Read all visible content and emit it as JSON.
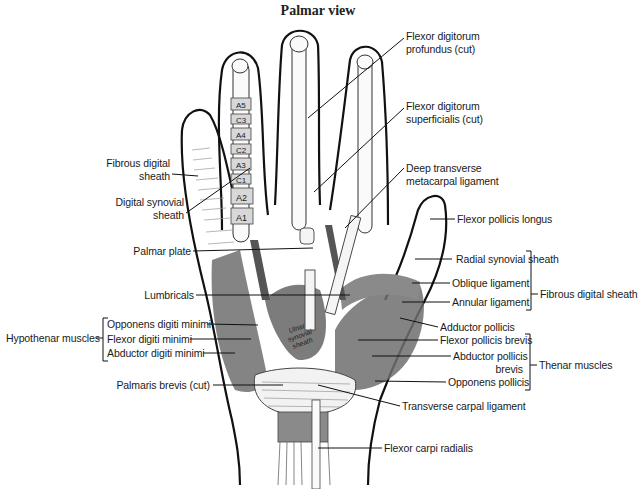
{
  "title": "Palmar view",
  "labels": {
    "fdp": [
      "Flexor digitorum",
      "profundus (cut)"
    ],
    "fds": [
      "Flexor digitorum",
      "superficialis (cut)"
    ],
    "dtml": [
      "Deep transverse",
      "metacarpal ligament"
    ],
    "fpl": "Flexor pollicis longus",
    "rss": "Radial synovial sheath",
    "oblique": "Oblique ligament",
    "annular": "Annular ligament",
    "fds_group": "Fibrous digital sheath",
    "add_poll": "Adductor pollicis",
    "fpb": "Flexor pollicis brevis",
    "apb": [
      "Abductor pollicis",
      "brevis"
    ],
    "op": "Opponens pollicis",
    "thenar": "Thenar muscles",
    "tcl": "Transverse carpal ligament",
    "fcr": "Flexor carpi radialis",
    "fib_sheath": [
      "Fibrous digital",
      "sheath"
    ],
    "dig_syn": [
      "Digital synovial",
      "sheath"
    ],
    "palmar_plate": "Palmar plate",
    "lumbricals": "Lumbricals",
    "odm": "Opponens digiti minimi",
    "fdm": "Flexor digiti minimi",
    "adm": "Abductor digiti minimi",
    "hypothenar": "Hypothenar muscles",
    "palmaris": "Palmaris brevis (cut)",
    "ulnar_sheath": [
      "Ulnar",
      "synovial",
      "sheath"
    ]
  },
  "pulleys": [
    "A5",
    "C3",
    "A4",
    "C2",
    "A3",
    "C1",
    "A2",
    "A1"
  ]
}
